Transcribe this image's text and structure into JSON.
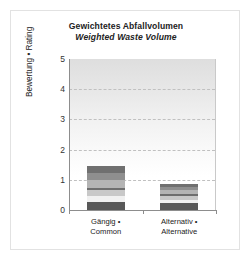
{
  "figure": {
    "width": 248,
    "height": 271,
    "background": "#ffffff",
    "border_color": "#e2e2e2"
  },
  "title": {
    "line_de": "Gewichtetes Abfallvolumen",
    "line_en": "Weighted Waste Volume"
  },
  "axes": {
    "ylabel": "Bewertung • Rating",
    "yticks": [
      "5",
      "4",
      "3",
      "2",
      "1",
      "0"
    ],
    "ymin": 0,
    "ymax": 5,
    "gridlines": [
      1,
      2,
      3,
      4
    ],
    "xtick_labels": [
      {
        "line1": "Gängig •",
        "line2": "Common"
      },
      {
        "line1": "Alternativ •",
        "line2": "Alternative"
      }
    ]
  },
  "chart_data": {
    "type": "bar",
    "xlabel": "",
    "ylabel": "Bewertung • Rating",
    "ylim": [
      0,
      5
    ],
    "grid": true,
    "legend": "none",
    "stacked": true,
    "categories": [
      "Gängig • Common",
      "Alternativ • Alternative"
    ],
    "totals": [
      1.45,
      0.87
    ],
    "series": [
      {
        "name": "segment-1",
        "color": "#585858",
        "values": [
          0.27,
          0.22
        ]
      },
      {
        "name": "segment-2",
        "color": "#f0f0f0",
        "values": [
          0.2,
          0.1
        ]
      },
      {
        "name": "segment-3",
        "color": "#c8c8c8",
        "values": [
          0.19,
          0.13
        ]
      },
      {
        "name": "segment-4",
        "color": "#6e6e6e",
        "values": [
          0.08,
          0.09
        ]
      },
      {
        "name": "segment-5",
        "color": "#b4b4b4",
        "values": [
          0.27,
          0.12
        ]
      },
      {
        "name": "segment-6",
        "color": "#8f8f8f",
        "values": [
          0.22,
          0.12
        ]
      },
      {
        "name": "segment-7",
        "color": "#707070",
        "values": [
          0.22,
          0.09
        ]
      }
    ]
  },
  "colors": {
    "axis": "#8d8d8d",
    "grid": "#c0c0c0",
    "text": "#222222",
    "plot_top": "#dedede",
    "plot_bottom": "#ffffff"
  }
}
